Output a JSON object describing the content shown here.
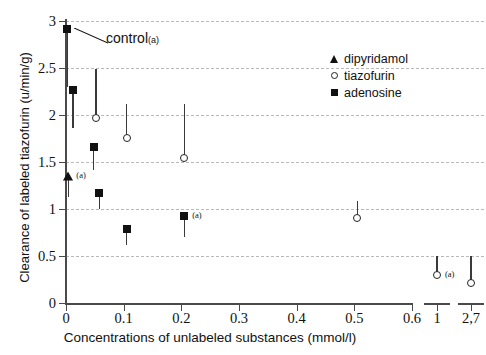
{
  "chart_data": {
    "type": "scatter",
    "title": "",
    "xlabel": "Concentrations of unlabeled substances (mmol/l)",
    "ylabel": "Clearance of labeled tiazofurin (u/min/g)",
    "xlim": [
      0,
      0.6
    ],
    "ylim": [
      0,
      3
    ],
    "ytick_labels": [
      "0",
      "0.5",
      "1",
      "1.5",
      "2",
      "2.5",
      "3"
    ],
    "ytick_values": [
      0,
      0.5,
      1,
      1.5,
      2,
      2.5,
      3
    ],
    "xtick_labels": [
      "0",
      "0.1",
      "0.2",
      "0.3",
      "0.4",
      "0.5",
      "0.6",
      "1",
      "2,7"
    ],
    "xtick_values": [
      0,
      0.1,
      0.2,
      0.3,
      0.4,
      0.5,
      0.6
    ],
    "broken_axis_ticks": [
      "1",
      "2,7"
    ],
    "grid": "horizontal-dashed",
    "legend_position": "upper-right",
    "annotations": [
      {
        "text": "control",
        "note": "(a)",
        "points_to_series": "adenosine",
        "points_to_index": 0
      }
    ],
    "series": [
      {
        "name": "adenosine",
        "marker": "filled-square",
        "points": [
          {
            "x": 0.002,
            "y": 2.92,
            "err_low": 2.3,
            "err_high": 2.92,
            "note": ""
          },
          {
            "x": 0.012,
            "y": 2.27,
            "err_low": 1.86,
            "err_high": 2.27,
            "note": ""
          },
          {
            "x": 0.048,
            "y": 1.66,
            "err_low": 1.42,
            "err_high": 1.66,
            "note": ""
          },
          {
            "x": 0.058,
            "y": 1.17,
            "err_low": 1.0,
            "err_high": 1.17,
            "note": ""
          },
          {
            "x": 0.105,
            "y": 0.79,
            "err_low": 0.62,
            "err_high": 0.79,
            "note": ""
          },
          {
            "x": 0.205,
            "y": 0.93,
            "err_low": 0.7,
            "err_high": 0.93,
            "note": "(a)"
          }
        ]
      },
      {
        "name": "tiazofurin",
        "marker": "open-circle",
        "points": [
          {
            "x": 0.052,
            "y": 1.97,
            "err_low": 1.97,
            "err_high": 2.49,
            "note": ""
          },
          {
            "x": 0.105,
            "y": 1.76,
            "err_low": 1.76,
            "err_high": 2.12,
            "note": ""
          },
          {
            "x": 0.205,
            "y": 1.54,
            "err_low": 1.54,
            "err_high": 2.12,
            "note": ""
          },
          {
            "x": 0.505,
            "y": 0.9,
            "err_low": 0.9,
            "err_high": 1.08,
            "note": ""
          },
          {
            "x": 1.0,
            "y": 0.3,
            "err_low": 0.3,
            "err_high": 0.5,
            "note": "(a)",
            "broken_axis": true
          },
          {
            "x": 2.7,
            "y": 0.21,
            "err_low": 0.21,
            "err_high": 0.5,
            "note": "",
            "broken_axis": true
          }
        ]
      },
      {
        "name": "dipyridamol",
        "marker": "filled-triangle",
        "points": [
          {
            "x": 0.004,
            "y": 1.35,
            "err_low": 1.13,
            "err_high": 1.35,
            "note": "(a)"
          }
        ]
      }
    ]
  },
  "legend": {
    "items": [
      {
        "label": "dipyridamol",
        "marker": "filled-triangle"
      },
      {
        "label": "tiazofurin",
        "marker": "open-circle"
      },
      {
        "label": "adenosine",
        "marker": "filled-square"
      }
    ]
  },
  "colors": {
    "axis": "#4a4a4a",
    "grid": "#b9b9b9",
    "marker": "#111111",
    "text": "#111111"
  }
}
